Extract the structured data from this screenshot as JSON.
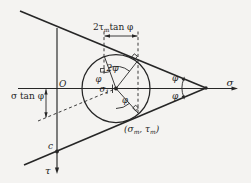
{
  "figure": {
    "axes": {
      "sigma": "σ",
      "tau": "τ",
      "origin": "O"
    },
    "labels": {
      "top_dimension": {
        "pre": "2τ",
        "sub": "m",
        "post": "tan φ"
      },
      "left_dimension": "σ tan φ",
      "center": {
        "base": "σ",
        "sub": "1"
      },
      "tangent_point": {
        "p1": "(σ",
        "s1": "m",
        "p2": ", τ",
        "s2": "m",
        "p3": ")"
      },
      "double_angle": "2φ",
      "phi_left": "φ",
      "phi_radius": "φ",
      "apex_phi_upper": "φ",
      "apex_phi_lower": "φ",
      "cohesion": "c"
    },
    "colors": {
      "stroke": "#262626",
      "background": "#f4f3f1"
    }
  }
}
